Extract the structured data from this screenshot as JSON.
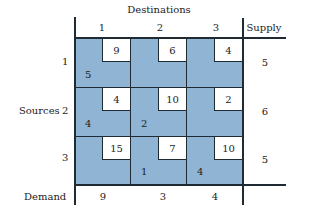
{
  "title": "Destinations",
  "destinations": [
    "1",
    "2",
    "3"
  ],
  "supply_label": "Supply",
  "sources_label": "Sources",
  "sources": [
    "1",
    "2",
    "3"
  ],
  "demand_label": "Demand",
  "costs": [
    [
      9,
      6,
      4
    ],
    [
      4,
      10,
      2
    ],
    [
      15,
      7,
      10
    ]
  ],
  "allocations": [
    [
      "5",
      "",
      ""
    ],
    [
      "4",
      "2",
      ""
    ],
    [
      "",
      "1",
      "4"
    ]
  ],
  "supply": [
    "5",
    "6",
    "5"
  ],
  "demand": [
    "9",
    "3",
    "4"
  ],
  "colors": {
    "cell_fill": "#8fb4d4",
    "lines": "#1f2a33"
  }
}
